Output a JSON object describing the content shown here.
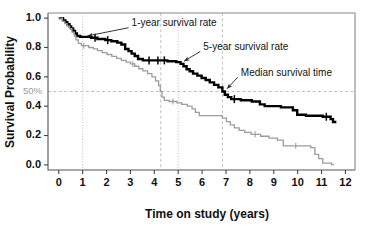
{
  "chart_data": {
    "type": "line",
    "title": "",
    "xlabel": "Time on study (years)",
    "ylabel": "Survival Probability",
    "xlim": [
      -0.45,
      12.4
    ],
    "ylim": [
      -0.035,
      1.035
    ],
    "xticks": [
      0,
      1,
      2,
      3,
      4,
      5,
      6,
      7,
      8,
      9,
      10,
      11,
      12
    ],
    "xticklabels": [
      "0",
      "1",
      "2",
      "3",
      "4",
      "5",
      "6",
      "7",
      "8",
      "9",
      "10",
      "11",
      "12"
    ],
    "yticks": [
      0.0,
      0.2,
      0.4,
      0.6,
      0.8,
      1.0
    ],
    "yticklabels": [
      "0.0",
      "0.2",
      "0.4",
      "0.6",
      "0.8",
      "1.0"
    ],
    "grid": false,
    "legend": "none",
    "series": [
      {
        "name": "primary-survival-curve",
        "style": "step",
        "color": "#000000",
        "points": [
          [
            0.0,
            1.0
          ],
          [
            0.18,
            1.0
          ],
          [
            0.18,
            0.985
          ],
          [
            0.28,
            0.985
          ],
          [
            0.28,
            0.972
          ],
          [
            0.36,
            0.972
          ],
          [
            0.36,
            0.958
          ],
          [
            0.45,
            0.958
          ],
          [
            0.45,
            0.944
          ],
          [
            0.52,
            0.944
          ],
          [
            0.52,
            0.93
          ],
          [
            0.6,
            0.93
          ],
          [
            0.6,
            0.912
          ],
          [
            0.68,
            0.912
          ],
          [
            0.68,
            0.896
          ],
          [
            0.76,
            0.896
          ],
          [
            0.76,
            0.878
          ],
          [
            0.9,
            0.878
          ],
          [
            0.9,
            0.872
          ],
          [
            1.35,
            0.872
          ],
          [
            1.35,
            0.866
          ],
          [
            1.62,
            0.866
          ],
          [
            1.62,
            0.858
          ],
          [
            1.95,
            0.858
          ],
          [
            1.95,
            0.85
          ],
          [
            2.2,
            0.85
          ],
          [
            2.2,
            0.842
          ],
          [
            2.45,
            0.842
          ],
          [
            2.45,
            0.833
          ],
          [
            2.62,
            0.833
          ],
          [
            2.62,
            0.82
          ],
          [
            2.78,
            0.82
          ],
          [
            2.78,
            0.79
          ],
          [
            2.92,
            0.79
          ],
          [
            2.92,
            0.775
          ],
          [
            3.05,
            0.775
          ],
          [
            3.05,
            0.758
          ],
          [
            3.18,
            0.758
          ],
          [
            3.18,
            0.742
          ],
          [
            3.32,
            0.742
          ],
          [
            3.32,
            0.722
          ],
          [
            3.52,
            0.722
          ],
          [
            3.52,
            0.712
          ],
          [
            4.55,
            0.712
          ],
          [
            4.55,
            0.706
          ],
          [
            4.92,
            0.706
          ],
          [
            4.92,
            0.7
          ],
          [
            5.1,
            0.7
          ],
          [
            5.1,
            0.688
          ],
          [
            5.22,
            0.688
          ],
          [
            5.22,
            0.672
          ],
          [
            5.35,
            0.672
          ],
          [
            5.35,
            0.652
          ],
          [
            5.48,
            0.652
          ],
          [
            5.48,
            0.638
          ],
          [
            5.62,
            0.638
          ],
          [
            5.62,
            0.622
          ],
          [
            5.8,
            0.622
          ],
          [
            5.8,
            0.608
          ],
          [
            5.98,
            0.608
          ],
          [
            5.98,
            0.592
          ],
          [
            6.15,
            0.592
          ],
          [
            6.15,
            0.578
          ],
          [
            6.32,
            0.578
          ],
          [
            6.32,
            0.562
          ],
          [
            6.5,
            0.562
          ],
          [
            6.5,
            0.545
          ],
          [
            6.68,
            0.545
          ],
          [
            6.68,
            0.528
          ],
          [
            6.85,
            0.528
          ],
          [
            6.85,
            0.5
          ],
          [
            6.95,
            0.5
          ],
          [
            6.95,
            0.478
          ],
          [
            7.08,
            0.478
          ],
          [
            7.08,
            0.462
          ],
          [
            7.22,
            0.462
          ],
          [
            7.22,
            0.448
          ],
          [
            7.62,
            0.448
          ],
          [
            7.62,
            0.44
          ],
          [
            8.08,
            0.44
          ],
          [
            8.08,
            0.432
          ],
          [
            8.42,
            0.432
          ],
          [
            8.42,
            0.412
          ],
          [
            8.62,
            0.412
          ],
          [
            8.62,
            0.4
          ],
          [
            9.3,
            0.4
          ],
          [
            9.3,
            0.392
          ],
          [
            9.8,
            0.392
          ],
          [
            9.8,
            0.372
          ],
          [
            9.98,
            0.372
          ],
          [
            9.98,
            0.342
          ],
          [
            10.35,
            0.342
          ],
          [
            10.35,
            0.335
          ],
          [
            11.05,
            0.335
          ],
          [
            11.05,
            0.328
          ],
          [
            11.38,
            0.328
          ],
          [
            11.38,
            0.312
          ],
          [
            11.48,
            0.312
          ],
          [
            11.48,
            0.292
          ],
          [
            11.62,
            0.292
          ]
        ],
        "censor_points": [
          [
            1.52,
            0.866
          ],
          [
            2.05,
            0.85
          ],
          [
            3.78,
            0.712
          ],
          [
            4.15,
            0.712
          ],
          [
            4.42,
            0.712
          ],
          [
            7.35,
            0.448
          ],
          [
            11.2,
            0.328
          ]
        ]
      },
      {
        "name": "secondary-survival-curve",
        "style": "step",
        "color": "#9d9d9d",
        "points": [
          [
            0.0,
            1.0
          ],
          [
            0.15,
            1.0
          ],
          [
            0.15,
            0.978
          ],
          [
            0.25,
            0.978
          ],
          [
            0.25,
            0.962
          ],
          [
            0.35,
            0.962
          ],
          [
            0.35,
            0.945
          ],
          [
            0.45,
            0.945
          ],
          [
            0.45,
            0.928
          ],
          [
            0.55,
            0.928
          ],
          [
            0.55,
            0.905
          ],
          [
            0.65,
            0.905
          ],
          [
            0.65,
            0.878
          ],
          [
            0.72,
            0.878
          ],
          [
            0.72,
            0.852
          ],
          [
            0.82,
            0.852
          ],
          [
            0.82,
            0.828
          ],
          [
            0.95,
            0.828
          ],
          [
            0.95,
            0.812
          ],
          [
            1.25,
            0.812
          ],
          [
            1.25,
            0.8
          ],
          [
            1.45,
            0.8
          ],
          [
            1.45,
            0.79
          ],
          [
            1.62,
            0.79
          ],
          [
            1.62,
            0.778
          ],
          [
            1.82,
            0.778
          ],
          [
            1.82,
            0.765
          ],
          [
            2.02,
            0.765
          ],
          [
            2.02,
            0.752
          ],
          [
            2.22,
            0.752
          ],
          [
            2.22,
            0.74
          ],
          [
            2.42,
            0.74
          ],
          [
            2.42,
            0.726
          ],
          [
            2.62,
            0.726
          ],
          [
            2.62,
            0.712
          ],
          [
            2.82,
            0.712
          ],
          [
            2.82,
            0.7
          ],
          [
            3.0,
            0.7
          ],
          [
            3.0,
            0.688
          ],
          [
            3.18,
            0.688
          ],
          [
            3.18,
            0.672
          ],
          [
            3.35,
            0.672
          ],
          [
            3.35,
            0.655
          ],
          [
            3.52,
            0.655
          ],
          [
            3.52,
            0.64
          ],
          [
            3.72,
            0.64
          ],
          [
            3.72,
            0.622
          ],
          [
            3.9,
            0.622
          ],
          [
            3.9,
            0.6
          ],
          [
            4.05,
            0.6
          ],
          [
            4.05,
            0.572
          ],
          [
            4.18,
            0.572
          ],
          [
            4.18,
            0.54
          ],
          [
            4.25,
            0.54
          ],
          [
            4.25,
            0.5
          ],
          [
            4.32,
            0.5
          ],
          [
            4.32,
            0.462
          ],
          [
            4.42,
            0.462
          ],
          [
            4.42,
            0.44
          ],
          [
            4.62,
            0.44
          ],
          [
            4.62,
            0.432
          ],
          [
            4.95,
            0.432
          ],
          [
            4.95,
            0.422
          ],
          [
            5.15,
            0.422
          ],
          [
            5.15,
            0.412
          ],
          [
            5.38,
            0.412
          ],
          [
            5.38,
            0.4
          ],
          [
            5.58,
            0.4
          ],
          [
            5.58,
            0.382
          ],
          [
            5.72,
            0.382
          ],
          [
            5.72,
            0.358
          ],
          [
            5.88,
            0.358
          ],
          [
            5.88,
            0.335
          ],
          [
            6.85,
            0.335
          ],
          [
            6.85,
            0.318
          ],
          [
            7.02,
            0.318
          ],
          [
            7.02,
            0.295
          ],
          [
            7.18,
            0.295
          ],
          [
            7.18,
            0.272
          ],
          [
            7.35,
            0.272
          ],
          [
            7.35,
            0.252
          ],
          [
            7.55,
            0.252
          ],
          [
            7.55,
            0.235
          ],
          [
            7.78,
            0.235
          ],
          [
            7.78,
            0.222
          ],
          [
            8.05,
            0.222
          ],
          [
            8.05,
            0.208
          ],
          [
            8.45,
            0.208
          ],
          [
            8.45,
            0.195
          ],
          [
            8.8,
            0.195
          ],
          [
            8.8,
            0.182
          ],
          [
            9.15,
            0.182
          ],
          [
            9.15,
            0.168
          ],
          [
            9.4,
            0.168
          ],
          [
            9.4,
            0.13
          ],
          [
            10.55,
            0.13
          ],
          [
            10.55,
            0.118
          ],
          [
            10.72,
            0.118
          ],
          [
            10.72,
            0.072
          ],
          [
            10.88,
            0.072
          ],
          [
            10.88,
            0.042
          ],
          [
            11.05,
            0.042
          ],
          [
            11.05,
            0.012
          ],
          [
            11.42,
            0.012
          ],
          [
            11.42,
            0.002
          ],
          [
            11.52,
            0.002
          ]
        ],
        "censor_points": [
          [
            1.05,
            0.812
          ],
          [
            3.1,
            0.688
          ],
          [
            4.78,
            0.432
          ],
          [
            8.22,
            0.208
          ],
          [
            9.92,
            0.13
          ]
        ]
      }
    ],
    "reference_lines": [
      {
        "name": "fifty-percent-horizontal",
        "orientation": "horizontal",
        "value": 0.5,
        "style": "dashed",
        "color": "#b9b9b9",
        "label": "50%"
      },
      {
        "name": "one-year-vertical",
        "orientation": "vertical",
        "value": 1.0,
        "style": "dotted",
        "color": "#b9b9b9"
      },
      {
        "name": "five-year-vertical",
        "orientation": "vertical",
        "value": 5.0,
        "style": "dotted",
        "color": "#b9b9b9"
      },
      {
        "name": "secondary-median-vertical",
        "orientation": "vertical",
        "value": 4.27,
        "style": "dashed",
        "color": "#b9b9b9"
      },
      {
        "name": "primary-median-vertical",
        "orientation": "vertical",
        "value": 6.85,
        "style": "dashed",
        "color": "#b9b9b9"
      }
    ],
    "annotations": [
      {
        "name": "one-year-survival-rate",
        "text": "1-year survival rate",
        "text_x": 3.05,
        "text_y": 0.962,
        "point_x": 1.08,
        "point_y": 0.872
      },
      {
        "name": "five-year-survival-rate",
        "text": "5-year survival rate",
        "text_y": 0.8,
        "text_x": 6.05,
        "point_x": 5.12,
        "point_y": 0.7
      },
      {
        "name": "median-survival-time",
        "text": "Median survival time",
        "text_x": 7.62,
        "text_y": 0.625,
        "point_x": 6.92,
        "point_y": 0.512
      }
    ]
  },
  "axes": {
    "x_title": "Time on study (years)",
    "y_title": "Survival Probability",
    "pct_label": "50%"
  }
}
